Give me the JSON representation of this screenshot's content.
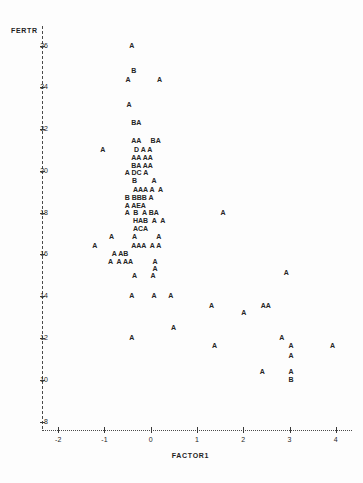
{
  "chart_data": {
    "type": "scatter",
    "title": "",
    "xlabel": "FACTOR1",
    "ylabel": "FERTR",
    "xlim": [
      -2.35,
      4.35
    ],
    "ylim": [
      7.6,
      26.6
    ],
    "xticks": [
      -2,
      -1,
      0,
      1,
      2,
      3,
      4
    ],
    "xtick_labels": [
      "-2",
      "-1",
      "0",
      "1",
      "2",
      "3",
      "4"
    ],
    "yticks": [
      26,
      24,
      22,
      20,
      18,
      16,
      14,
      12,
      10,
      8
    ],
    "ytick_labels": [
      "26",
      "24",
      "22",
      "20",
      "18",
      "16",
      "14",
      "12",
      "10",
      "8"
    ],
    "grid": false,
    "legend": "none",
    "marker_note": "Letter glyphs encode overplot counts: A=1, B=2, C=3, D=4, E=5, H=8",
    "axis_style": "dashed-dotted character axes",
    "points": [
      {
        "x": -0.42,
        "y": 26.0,
        "label": "A"
      },
      {
        "x": -0.38,
        "y": 24.8,
        "label": "B"
      },
      {
        "x": -0.5,
        "y": 24.35,
        "label": "A"
      },
      {
        "x": 0.18,
        "y": 24.35,
        "label": "A"
      },
      {
        "x": -0.48,
        "y": 23.15,
        "label": "A"
      },
      {
        "x": -0.38,
        "y": 22.3,
        "label": "BA"
      },
      {
        "x": -0.38,
        "y": 21.42,
        "label": "AA"
      },
      {
        "x": 0.04,
        "y": 21.42,
        "label": "BA"
      },
      {
        "x": -1.05,
        "y": 21.02,
        "label": "A"
      },
      {
        "x": -0.32,
        "y": 21.02,
        "label": "D A A"
      },
      {
        "x": -0.38,
        "y": 20.62,
        "label": "AA AA"
      },
      {
        "x": -0.38,
        "y": 20.22,
        "label": "BA AA"
      },
      {
        "x": -0.52,
        "y": 19.9,
        "label": "A DC A"
      },
      {
        "x": -0.36,
        "y": 19.5,
        "label": "B"
      },
      {
        "x": 0.06,
        "y": 19.5,
        "label": "A"
      },
      {
        "x": -0.34,
        "y": 19.1,
        "label": "AAA A  A"
      },
      {
        "x": -0.52,
        "y": 18.72,
        "label": "B BBB A"
      },
      {
        "x": -0.52,
        "y": 18.34,
        "label": "A AEA"
      },
      {
        "x": -0.52,
        "y": 17.98,
        "label": "A  B  A BA"
      },
      {
        "x": -0.34,
        "y": 17.62,
        "label": "HAB  A  A"
      },
      {
        "x": -0.34,
        "y": 17.24,
        "label": "ACA"
      },
      {
        "x": -0.86,
        "y": 16.82,
        "label": "A"
      },
      {
        "x": -0.36,
        "y": 16.82,
        "label": "A"
      },
      {
        "x": 0.16,
        "y": 16.82,
        "label": "A"
      },
      {
        "x": -1.22,
        "y": 16.42,
        "label": "A"
      },
      {
        "x": -0.38,
        "y": 16.42,
        "label": "AAA  A A"
      },
      {
        "x": -0.8,
        "y": 16.02,
        "label": "A AB"
      },
      {
        "x": -0.88,
        "y": 15.65,
        "label": "A  A AA"
      },
      {
        "x": 0.08,
        "y": 15.65,
        "label": "A"
      },
      {
        "x": 0.08,
        "y": 15.3,
        "label": "A"
      },
      {
        "x": -0.36,
        "y": 14.95,
        "label": "A"
      },
      {
        "x": 0.04,
        "y": 14.95,
        "label": "A"
      },
      {
        "x": 1.55,
        "y": 17.98,
        "label": "A"
      },
      {
        "x": 2.92,
        "y": 15.12,
        "label": "A"
      },
      {
        "x": -0.42,
        "y": 14.0,
        "label": "A"
      },
      {
        "x": 0.06,
        "y": 14.0,
        "label": "A"
      },
      {
        "x": 0.42,
        "y": 14.0,
        "label": "A"
      },
      {
        "x": 1.3,
        "y": 13.52,
        "label": "A"
      },
      {
        "x": 2.0,
        "y": 13.22,
        "label": "A"
      },
      {
        "x": 2.42,
        "y": 13.52,
        "label": "AA"
      },
      {
        "x": 0.48,
        "y": 12.48,
        "label": "A"
      },
      {
        "x": -0.42,
        "y": 12.0,
        "label": "A"
      },
      {
        "x": 2.82,
        "y": 12.02,
        "label": "A"
      },
      {
        "x": 1.37,
        "y": 11.6,
        "label": "A"
      },
      {
        "x": 3.02,
        "y": 11.6,
        "label": "A"
      },
      {
        "x": 3.92,
        "y": 11.6,
        "label": "A"
      },
      {
        "x": 3.02,
        "y": 11.15,
        "label": "A"
      },
      {
        "x": 2.4,
        "y": 10.38,
        "label": "A"
      },
      {
        "x": 3.02,
        "y": 10.38,
        "label": "A"
      },
      {
        "x": 3.02,
        "y": 9.98,
        "label": "B"
      }
    ]
  },
  "plot": {
    "y_axis_title": "FERTR",
    "x_axis_title": "FACTOR1"
  }
}
